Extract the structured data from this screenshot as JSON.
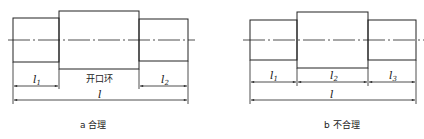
{
  "figure": {
    "panels": [
      {
        "id": "a",
        "caption": "a 合理",
        "dimensions": {
          "segment_labels": [
            {
              "symbol": "l",
              "sub": "1"
            },
            {
              "symbol": "l",
              "sub": "2"
            }
          ],
          "middle_note": "开口环",
          "total_label": "l"
        }
      },
      {
        "id": "b",
        "caption": "b 不合理",
        "dimensions": {
          "segment_labels": [
            {
              "symbol": "l",
              "sub": "1"
            },
            {
              "symbol": "l",
              "sub": "2"
            },
            {
              "symbol": "l",
              "sub": "3"
            }
          ],
          "total_label": "l"
        }
      }
    ],
    "colors": {
      "line": "#222222",
      "background": "#ffffff"
    }
  }
}
